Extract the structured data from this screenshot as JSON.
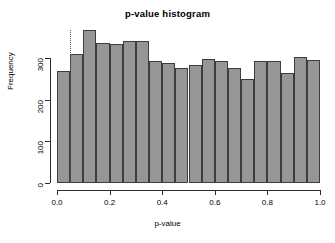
{
  "chart_data": {
    "type": "bar",
    "title": "p-value histogram",
    "xlabel": "p-value",
    "ylabel": "Frequency",
    "xlim": [
      0.0,
      1.0
    ],
    "ylim": [
      0,
      375
    ],
    "grid": false,
    "legend": null,
    "bin_width": 0.05,
    "bin_edges": [
      0.0,
      0.05,
      0.1,
      0.15,
      0.2,
      0.25,
      0.3,
      0.35,
      0.4,
      0.45,
      0.5,
      0.55,
      0.6,
      0.65,
      0.7,
      0.75,
      0.8,
      0.85,
      0.9,
      0.95,
      1.0
    ],
    "categories": [
      "0.00-0.05",
      "0.05-0.10",
      "0.10-0.15",
      "0.15-0.20",
      "0.20-0.25",
      "0.25-0.30",
      "0.30-0.35",
      "0.35-0.40",
      "0.40-0.45",
      "0.45-0.50",
      "0.50-0.55",
      "0.55-0.60",
      "0.60-0.65",
      "0.65-0.70",
      "0.70-0.75",
      "0.75-0.80",
      "0.80-0.85",
      "0.85-0.90",
      "0.90-0.95",
      "0.95-1.00"
    ],
    "values": [
      268,
      310,
      367,
      337,
      334,
      340,
      340,
      292,
      288,
      277,
      284,
      298,
      292,
      277,
      249,
      292,
      292,
      263,
      302,
      295
    ],
    "bar_fill_color": "#969696",
    "bar_border_color": "#3d3d3d",
    "annotations": [
      {
        "name": "significance-threshold",
        "type": "vline",
        "x": 0.05,
        "style": "dotted",
        "color": "#555555"
      }
    ],
    "x_ticks": [
      {
        "value": 0.0,
        "label": "0.0"
      },
      {
        "value": 0.2,
        "label": "0.2"
      },
      {
        "value": 0.4,
        "label": "0.4"
      },
      {
        "value": 0.6,
        "label": "0.6"
      },
      {
        "value": 0.8,
        "label": "0.8"
      },
      {
        "value": 1.0,
        "label": "1.0"
      }
    ],
    "y_ticks": [
      {
        "value": 0,
        "label": "0"
      },
      {
        "value": 100,
        "label": "100"
      },
      {
        "value": 200,
        "label": "200"
      },
      {
        "value": 300,
        "label": "300"
      }
    ]
  }
}
